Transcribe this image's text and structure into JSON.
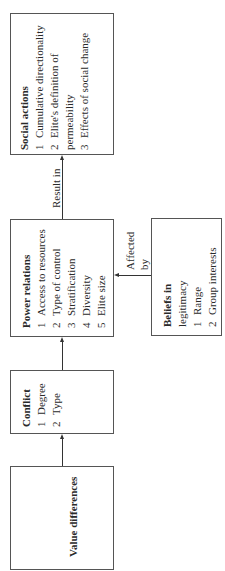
{
  "diagram": {
    "orientation": "rotated-90-ccw",
    "boxes": {
      "social_actions": {
        "title": "Social actions",
        "items": [
          {
            "num": "1",
            "text": "Cumulative directionality"
          },
          {
            "num": "2",
            "text": "Elite's definition of",
            "cont": "permeability"
          },
          {
            "num": "3",
            "text": "Effects of social change"
          }
        ]
      },
      "power_relations": {
        "title": "Power relations",
        "items": [
          {
            "num": "1",
            "text": "Access to resources"
          },
          {
            "num": "2",
            "text": "Type of control"
          },
          {
            "num": "3",
            "text": "Stratification"
          },
          {
            "num": "4",
            "text": "Diversity"
          },
          {
            "num": "5",
            "text": "Elite size"
          }
        ]
      },
      "beliefs": {
        "title_line1": "Beliefs in",
        "title_line2": "legitimacy",
        "items": [
          {
            "num": "1",
            "text": "Range"
          },
          {
            "num": "2",
            "text": "Group interests"
          }
        ]
      },
      "conflict": {
        "title": "Conflict",
        "items": [
          {
            "num": "1",
            "text": "Degree"
          },
          {
            "num": "2",
            "text": "Type"
          }
        ]
      },
      "value_differences": {
        "title": "Value differences"
      }
    },
    "edges": [
      {
        "from": "value_differences",
        "to": "conflict",
        "label": ""
      },
      {
        "from": "conflict",
        "to": "power_relations",
        "label": ""
      },
      {
        "from": "power_relations",
        "to": "social_actions",
        "label": "Result in"
      },
      {
        "from": "beliefs",
        "to": "power_relations",
        "label_line1": "Affected",
        "label_line2": "by"
      }
    ]
  }
}
